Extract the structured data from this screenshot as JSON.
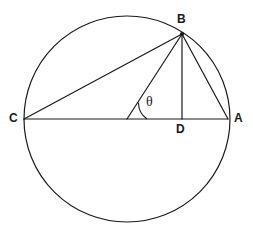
{
  "figure": {
    "type": "circle-geometry-diagram",
    "width": 253,
    "height": 232,
    "background_color": "#ffffff",
    "stroke_color": "#1a1a1a",
    "stroke_width": 1.2
  },
  "labels": {
    "A": "A",
    "B": "B",
    "C": "C",
    "D": "D",
    "theta": "θ"
  },
  "geometry": {
    "circle": {
      "cx": 127,
      "cy": 119,
      "r": 103
    },
    "points": {
      "A": {
        "x": 228,
        "y": 119
      },
      "B": {
        "x": 182,
        "y": 34
      },
      "C": {
        "x": 24,
        "y": 119
      },
      "D": {
        "x": 182,
        "y": 119
      },
      "O": {
        "x": 127,
        "y": 119
      }
    },
    "segments": [
      {
        "name": "chord-CB",
        "from": "C",
        "to": "B"
      },
      {
        "name": "diameter-CA",
        "from": "C",
        "to": "A"
      },
      {
        "name": "radius-OB",
        "from": "O",
        "to": "B"
      },
      {
        "name": "altitude-BD",
        "from": "B",
        "to": "D"
      },
      {
        "name": "chord-BA",
        "from": "B",
        "to": "A"
      }
    ],
    "angle_arc": {
      "name": "theta-arc",
      "vertex": "O",
      "radius": 20,
      "path": "M 147 119 A 20 20 0 0 1 138.5 102.7"
    }
  }
}
